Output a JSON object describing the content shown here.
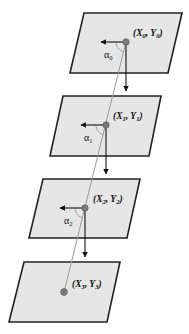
{
  "diagram": {
    "colors": {
      "plane_fill": "#e6e6e6",
      "plane_stroke": "#222222",
      "trajectory": "#9a9a9a",
      "dot": "#7a7a7a",
      "arrow": "#111111"
    },
    "levels": [
      {
        "index": 0,
        "coord_label": {
          "open": "(X",
          "sub1": "0",
          "mid": ", Y",
          "sub2": "0",
          "close": ")"
        },
        "angle_label": {
          "symbol": "α",
          "sub": "0"
        },
        "point": [
          126,
          42
        ]
      },
      {
        "index": 1,
        "coord_label": {
          "open": "(X",
          "sub1": "1",
          "mid": ", Y",
          "sub2": "1",
          "close": ")"
        },
        "angle_label": {
          "symbol": "α",
          "sub": "1"
        },
        "point": [
          106,
          125
        ]
      },
      {
        "index": 2,
        "coord_label": {
          "open": "(X",
          "sub1": "2",
          "mid": ", Y",
          "sub2": "2",
          "close": ")"
        },
        "angle_label": {
          "symbol": "α",
          "sub": "2"
        },
        "point": [
          85,
          208
        ]
      },
      {
        "index": 3,
        "coord_label": {
          "open": "(X",
          "sub1": "3",
          "mid": ", Y",
          "sub2": "3",
          "close": ")"
        },
        "point": [
          64,
          292
        ]
      }
    ]
  }
}
